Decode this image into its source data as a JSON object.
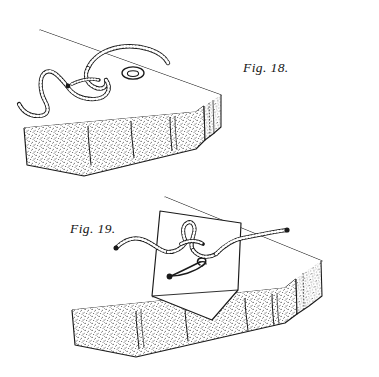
{
  "page": {
    "background_color": "#ffffff",
    "ink_color": "#1a1a1a",
    "width": 379,
    "height": 377,
    "style": "vintage engraved line illustration, stippled shading"
  },
  "figures": [
    {
      "id": "fig-18",
      "caption": "Fig. 18.",
      "caption_position": {
        "x": 243,
        "y": 60
      },
      "subject": "mattress corner with lacing cord knotted and eyelet",
      "parts": [
        {
          "name": "mattress-body",
          "description": "rectangular mattress drawn in perspective, stippled side panel"
        },
        {
          "name": "mattress-top-surface",
          "description": "plain white top surface bounded by thin diagonal far edge line"
        },
        {
          "name": "tufting-seams",
          "description": "three short vertical tufting seam lines on the stippled side panel",
          "count": 3
        },
        {
          "name": "end-piping-seam",
          "description": "vertical piping seam at right end of mattress"
        },
        {
          "name": "lacing-cord",
          "description": "braided dark cord looped into a slip knot lying on the mattress top and trailing off the left edge"
        },
        {
          "name": "eyelet-grommet",
          "description": "small oval metal eyelet set into the mattress top, right of the knot"
        }
      ]
    },
    {
      "id": "fig-19",
      "caption": "Fig. 19.",
      "caption_position": {
        "x": 70,
        "y": 221
      },
      "subject": "mattress with cloth flap turned back showing cord and safety pin",
      "parts": [
        {
          "name": "mattress-body",
          "description": "rectangular mattress drawn in perspective, stippled side panel"
        },
        {
          "name": "mattress-top-surface",
          "description": "plain white top surface"
        },
        {
          "name": "tufting-seams",
          "description": "tufting seam lines on the stippled side panel",
          "count": 4
        },
        {
          "name": "cloth-flap",
          "description": "white quadrilateral cloth flap folded forward over the mattress edge, pointed at lower corner"
        },
        {
          "name": "lacing-cord",
          "description": "braided dark cord tied in a bow-like knot across the flap, running off to the right over the mattress"
        },
        {
          "name": "safety-pin",
          "description": "open-coil safety pin lying on the cloth flap below the knot"
        }
      ]
    }
  ],
  "captions": {
    "fig18": "Fig. 18.",
    "fig19": "Fig. 19."
  }
}
